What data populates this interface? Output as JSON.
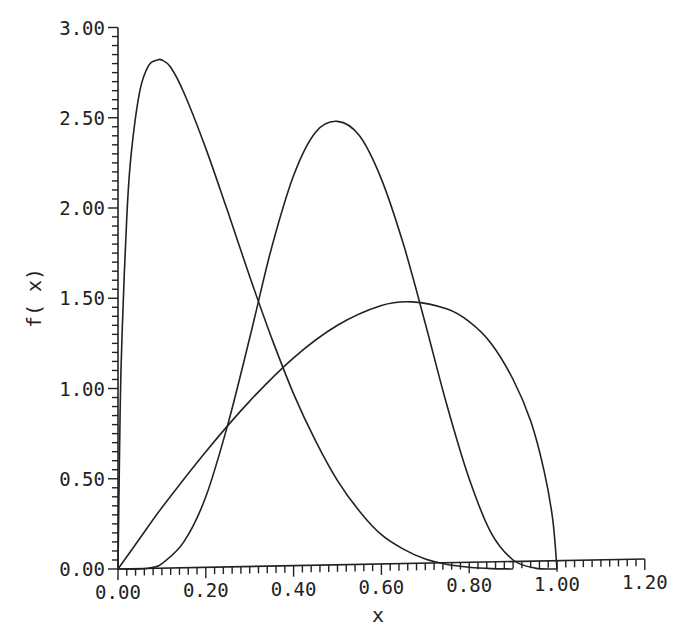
{
  "chart_data": {
    "type": "line",
    "title": "",
    "xlabel": "x",
    "ylabel": "f( x)",
    "xlim": [
      0,
      1.2
    ],
    "ylim": [
      0,
      3.0
    ],
    "grid": false,
    "legend": null,
    "x_ticks": [
      "0.00",
      "0.20",
      "0.40",
      "0.60",
      "0.80",
      "1.00",
      "1.20"
    ],
    "y_ticks": [
      "0.00",
      "0.50",
      "1.00",
      "1.50",
      "2.00",
      "2.50",
      "3.00"
    ],
    "x_minor_per_major": 10,
    "y_minor_per_major": 10,
    "series": [
      {
        "name": "curve-1 (peak near x=0.10)",
        "x": [
          0.0,
          0.005,
          0.01,
          0.02,
          0.03,
          0.05,
          0.07,
          0.09,
          0.1,
          0.12,
          0.15,
          0.2,
          0.25,
          0.3,
          0.35,
          0.4,
          0.45,
          0.5,
          0.55,
          0.6,
          0.65,
          0.7,
          0.75,
          0.8,
          0.85,
          0.9
        ],
        "y": [
          0.0,
          0.9,
          1.35,
          1.95,
          2.3,
          2.65,
          2.79,
          2.82,
          2.82,
          2.78,
          2.64,
          2.33,
          1.98,
          1.62,
          1.28,
          0.97,
          0.71,
          0.49,
          0.32,
          0.19,
          0.11,
          0.055,
          0.025,
          0.01,
          0.002,
          0.0
        ]
      },
      {
        "name": "curve-2 (peak near x=0.50)",
        "x": [
          0.0,
          0.05,
          0.08,
          0.1,
          0.15,
          0.2,
          0.25,
          0.3,
          0.35,
          0.4,
          0.45,
          0.5,
          0.55,
          0.6,
          0.65,
          0.7,
          0.75,
          0.8,
          0.85,
          0.9,
          0.95,
          1.0
        ],
        "y": [
          0.0,
          0.0,
          0.01,
          0.03,
          0.15,
          0.4,
          0.8,
          1.28,
          1.78,
          2.18,
          2.42,
          2.48,
          2.4,
          2.16,
          1.8,
          1.36,
          0.9,
          0.5,
          0.2,
          0.05,
          0.005,
          0.0
        ]
      },
      {
        "name": "curve-3 (peak near x=0.67)",
        "x": [
          0.0,
          0.05,
          0.1,
          0.2,
          0.3,
          0.4,
          0.5,
          0.6,
          0.67,
          0.75,
          0.8,
          0.85,
          0.9,
          0.94,
          0.97,
          0.99,
          1.0
        ],
        "y": [
          0.0,
          0.17,
          0.34,
          0.65,
          0.93,
          1.17,
          1.35,
          1.46,
          1.48,
          1.44,
          1.37,
          1.25,
          1.05,
          0.82,
          0.55,
          0.28,
          0.0
        ]
      }
    ]
  }
}
